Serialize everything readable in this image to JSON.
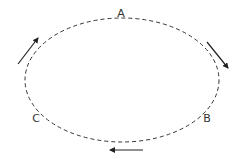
{
  "diagram": {
    "type": "cycle",
    "shape": "dashed-ellipse",
    "ellipse": {
      "cx": 122,
      "cy": 80,
      "rx": 97,
      "ry": 62,
      "stroke": "#333333",
      "dash": "4 3"
    },
    "nodes": [
      {
        "id": "A",
        "label": "A",
        "x": 121,
        "y": 17
      },
      {
        "id": "B",
        "label": "B",
        "x": 207,
        "y": 122
      },
      {
        "id": "C",
        "label": "C",
        "x": 36,
        "y": 122
      }
    ],
    "arrows": [
      {
        "name": "arrow-a-to-b",
        "from": [
          207,
          42
        ],
        "to": [
          228,
          68
        ],
        "direction": "clockwise",
        "color": "#222222"
      },
      {
        "name": "arrow-b-to-c",
        "from": [
          143,
          150
        ],
        "to": [
          110,
          150
        ],
        "direction": "clockwise",
        "color": "#222222"
      },
      {
        "name": "arrow-c-to-a",
        "from": [
          18,
          64
        ],
        "to": [
          38,
          38
        ],
        "direction": "clockwise",
        "color": "#222222"
      }
    ]
  }
}
